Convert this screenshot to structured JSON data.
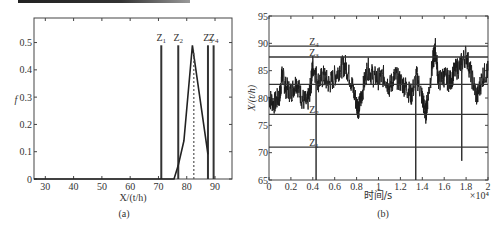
{
  "chart_data": [
    {
      "id": "a",
      "type": "line",
      "caption": "(a)",
      "title": "",
      "xlabel": "X/(t/h)",
      "ylabel": "f",
      "xlim": [
        26,
        96
      ],
      "ylim": [
        0,
        0.59
      ],
      "xticks": [
        "30",
        "40",
        "50",
        "60",
        "70",
        "80",
        "90"
      ],
      "yticks": [
        "0",
        "0.1",
        "0.2",
        "0.3",
        "0.4",
        "0.5"
      ],
      "grid": false,
      "series": [
        {
          "name": "membership function f",
          "style": "solid",
          "x": [
            26,
            75.5,
            77,
            79,
            82,
            87.5
          ],
          "y": [
            0,
            0,
            0.05,
            0.14,
            0.49,
            0.09
          ]
        },
        {
          "name": "peak (dashed)",
          "style": "dashed",
          "x": [
            82.5,
            82.5
          ],
          "y": [
            0,
            0.47
          ]
        }
      ],
      "vlines": [
        {
          "label": "Z1",
          "x": 71
        },
        {
          "label": "Z2",
          "x": 77
        },
        {
          "label": "Z3",
          "x": 87.5
        },
        {
          "label": "Z4",
          "x": 89.5
        }
      ],
      "vline_top": 0.49
    },
    {
      "id": "b",
      "type": "line",
      "caption": "(b)",
      "title": "",
      "xlabel": "时间/s",
      "ylabel": "X/(t/h)",
      "x_multiplier": "×10⁴",
      "xlim": [
        0,
        2
      ],
      "ylim": [
        65,
        95
      ],
      "xticks": [
        "0",
        "0.2",
        "0.4",
        "0.6",
        "0.8",
        "1",
        "1.2",
        "1.4",
        "1.6",
        "1.8",
        "2"
      ],
      "yticks": [
        "65",
        "70",
        "75",
        "80",
        "85",
        "90",
        "95"
      ],
      "grid": false,
      "hlines": [
        {
          "label": "Z4",
          "y": 89.5
        },
        {
          "label": "Z3",
          "y": 87.5
        },
        {
          "label": "",
          "y": 82.5
        },
        {
          "label": "Z2",
          "y": 77
        },
        {
          "label": "Z1",
          "y": 71
        }
      ],
      "spikes": [
        {
          "x": 0.43,
          "y_min": 65
        },
        {
          "x": 1.34,
          "y_min": 65
        },
        {
          "x": 1.76,
          "y_min": 68.5
        }
      ],
      "series": [
        {
          "name": "X (noisy signal)",
          "approx_mean": 82.5,
          "approx_range": [
            75.5,
            89.5
          ],
          "x": [
            0,
            0.05,
            0.1,
            0.12,
            0.15,
            0.2,
            0.25,
            0.3,
            0.35,
            0.38,
            0.4,
            0.45,
            0.5,
            0.55,
            0.6,
            0.65,
            0.7,
            0.75,
            0.8,
            0.82,
            0.85,
            0.9,
            0.95,
            1.0,
            1.05,
            1.1,
            1.15,
            1.2,
            1.25,
            1.3,
            1.35,
            1.4,
            1.43,
            1.45,
            1.5,
            1.52,
            1.55,
            1.6,
            1.65,
            1.7,
            1.75,
            1.8,
            1.85,
            1.9,
            1.95,
            2.0
          ],
          "y": [
            80,
            79,
            80.5,
            84.5,
            82,
            81,
            83,
            80,
            79,
            82,
            86,
            83,
            84,
            82.5,
            84,
            85.5,
            86,
            83,
            79,
            78,
            81,
            85.5,
            84,
            83.5,
            84,
            82,
            84,
            83,
            82,
            80.5,
            84,
            80,
            77,
            80,
            87,
            89,
            83,
            84,
            83,
            85,
            86,
            88,
            84,
            80,
            84,
            85
          ]
        }
      ]
    }
  ]
}
